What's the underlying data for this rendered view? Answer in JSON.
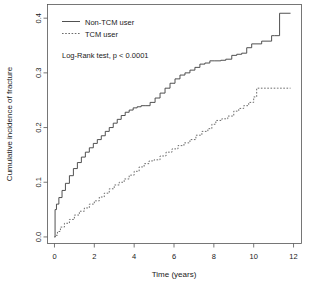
{
  "chart_data": {
    "type": "line",
    "title": "",
    "subtitle": "",
    "xlabel": "Time (years)",
    "ylabel": "Cumulative incidence of fracture",
    "xlim": [
      -0.35,
      12.4
    ],
    "ylim": [
      -0.012,
      0.425
    ],
    "xticks": [
      0,
      2,
      4,
      6,
      8,
      10,
      12
    ],
    "xticklabels": [
      "0",
      "2",
      "4",
      "6",
      "8",
      "10",
      "12"
    ],
    "yticks": [
      0.0,
      0.1,
      0.2,
      0.3,
      0.4
    ],
    "yticklabels": [
      "0.0",
      "0.1",
      "0.2",
      "0.3",
      "0.4"
    ],
    "grid": false,
    "legend_position": "top-left",
    "annotations": [
      {
        "name": "logrank-annotation",
        "text": "Log-Rank test, p < 0.0001",
        "x": 1.05,
        "y": 0.327
      }
    ],
    "series": [
      {
        "name": "Non-TCM user",
        "style": "solid",
        "color": "#3d3d3d",
        "x": [
          0.0,
          0.03,
          0.1,
          0.22,
          0.38,
          0.55,
          0.75,
          0.95,
          1.15,
          1.35,
          1.55,
          1.75,
          1.95,
          2.15,
          2.35,
          2.55,
          2.75,
          2.95,
          3.15,
          3.35,
          3.55,
          3.75,
          3.95,
          4.15,
          4.35,
          4.55,
          4.8,
          5.05,
          5.3,
          5.55,
          5.8,
          6.05,
          6.3,
          6.55,
          6.8,
          7.05,
          7.3,
          7.55,
          7.8,
          8.05,
          8.35,
          8.6,
          8.9,
          9.15,
          9.4,
          9.65,
          9.9,
          10.4,
          10.9,
          11.05,
          11.3,
          11.85
        ],
        "y": [
          0.0,
          0.05,
          0.06,
          0.072,
          0.085,
          0.098,
          0.112,
          0.125,
          0.136,
          0.146,
          0.155,
          0.163,
          0.171,
          0.178,
          0.185,
          0.193,
          0.2,
          0.208,
          0.215,
          0.222,
          0.228,
          0.232,
          0.236,
          0.238,
          0.24,
          0.24,
          0.246,
          0.254,
          0.263,
          0.272,
          0.281,
          0.289,
          0.296,
          0.3,
          0.305,
          0.31,
          0.316,
          0.318,
          0.322,
          0.322,
          0.323,
          0.325,
          0.332,
          0.334,
          0.336,
          0.346,
          0.353,
          0.358,
          0.368,
          0.368,
          0.409,
          0.409
        ]
      },
      {
        "name": "TCM user",
        "style": "dashed",
        "color": "#5a5a5a",
        "x": [
          0.0,
          0.05,
          0.15,
          0.3,
          0.5,
          0.75,
          1.0,
          1.25,
          1.5,
          1.75,
          2.0,
          2.25,
          2.5,
          2.75,
          3.0,
          3.25,
          3.5,
          3.75,
          4.0,
          4.25,
          4.5,
          4.75,
          5.0,
          5.3,
          5.6,
          5.9,
          6.2,
          6.5,
          6.8,
          7.1,
          7.4,
          7.7,
          7.9,
          8.1,
          8.4,
          8.7,
          9.0,
          9.25,
          9.5,
          9.75,
          10.0,
          10.15,
          10.6,
          11.2,
          11.85
        ],
        "y": [
          0.0,
          0.003,
          0.01,
          0.018,
          0.025,
          0.032,
          0.04,
          0.047,
          0.053,
          0.06,
          0.066,
          0.073,
          0.08,
          0.088,
          0.095,
          0.1,
          0.106,
          0.113,
          0.12,
          0.128,
          0.134,
          0.139,
          0.141,
          0.148,
          0.155,
          0.161,
          0.167,
          0.172,
          0.178,
          0.186,
          0.193,
          0.198,
          0.206,
          0.213,
          0.216,
          0.221,
          0.23,
          0.235,
          0.24,
          0.246,
          0.256,
          0.272,
          0.272,
          0.272,
          0.272
        ]
      }
    ]
  },
  "legend": {
    "entries": [
      {
        "label": "Non-TCM user",
        "style": "solid"
      },
      {
        "label": "TCM user",
        "style": "dashed"
      }
    ]
  }
}
